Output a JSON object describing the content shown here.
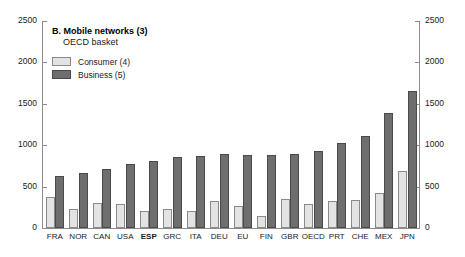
{
  "chart_data": {
    "type": "bar",
    "title": "B. Mobile networks (3)",
    "subtitle": "OECD basket",
    "xlabel": "",
    "ylabel": "",
    "ylim": [
      0,
      2500
    ],
    "yticks": [
      0,
      500,
      1000,
      1500,
      2000,
      2500
    ],
    "ytick_labels": [
      "0",
      "500",
      "1000",
      "1500",
      "2000",
      "2500"
    ],
    "grid": false,
    "legend_position": "top-left",
    "dual_axis": true,
    "highlight_category": "ESP",
    "categories": [
      "FRA",
      "NOR",
      "CAN",
      "USA",
      "ESP",
      "GRC",
      "ITA",
      "DEU",
      "EU",
      "FIN",
      "GBR",
      "OECD",
      "PRT",
      "CHE",
      "MEX",
      "JPN"
    ],
    "series": [
      {
        "name": "Consumer (4)",
        "color": "#e3e3e3",
        "values": [
          380,
          230,
          305,
          290,
          205,
          230,
          200,
          325,
          270,
          145,
          355,
          285,
          330,
          335,
          425,
          690
        ]
      },
      {
        "name": "Business (5)",
        "color": "#6e6e6e",
        "values": [
          625,
          660,
          710,
          770,
          815,
          855,
          865,
          890,
          880,
          880,
          890,
          935,
          1030,
          1110,
          1385,
          1660
        ]
      }
    ]
  },
  "axes": {
    "left_ticks": [
      "2500",
      "2000",
      "1500",
      "1000",
      "500",
      "0"
    ],
    "right_ticks": [
      "2500",
      "2000",
      "1500",
      "1000",
      "500",
      "0"
    ]
  }
}
